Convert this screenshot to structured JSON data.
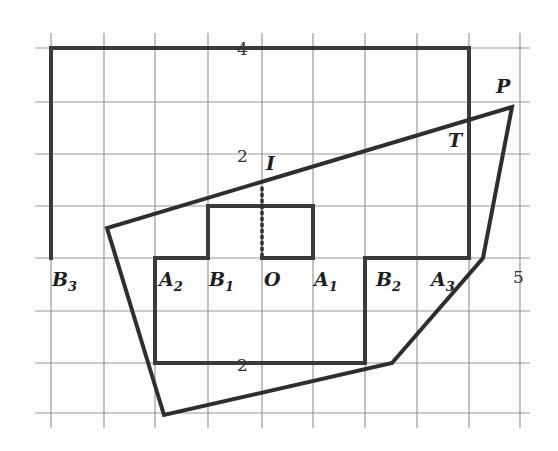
{
  "figure": {
    "tick_labels": {
      "y4": "4",
      "y2": "2",
      "yneg2": "2",
      "x5": "5"
    },
    "points": {
      "P": "P",
      "T": "T",
      "I": "I",
      "O": "O",
      "A1": "A",
      "A1_sub": "1",
      "A2": "A",
      "A2_sub": "2",
      "A3": "A",
      "A3_sub": "3",
      "B1": "B",
      "B1_sub": "1",
      "B2": "B",
      "B2_sub": "2",
      "B3": "B",
      "B3_sub": "3"
    },
    "colors": {
      "grid": "#9a9a9a",
      "stroke": "#2e2e2e",
      "background": "#fdfdfd"
    }
  }
}
